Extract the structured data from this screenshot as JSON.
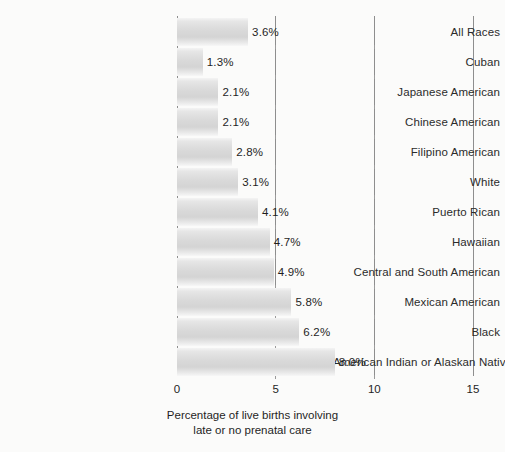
{
  "chart_data": {
    "type": "bar",
    "orientation": "horizontal",
    "title": "",
    "xlabel": "Percentage of live births involving late or no prenatal care",
    "xlabel_lines": [
      "Percentage of live births involving",
      "late or no prenatal care"
    ],
    "ylabel": "",
    "xlim": [
      0,
      15
    ],
    "xticks": [
      0,
      5,
      10,
      15
    ],
    "xtick_labels": [
      "0",
      "5",
      "10",
      "15"
    ],
    "grid": true,
    "grid_axis": "x",
    "legend": false,
    "value_suffix": "%",
    "categories": [
      "All Races",
      "Cuban",
      "Japanese American",
      "Chinese American",
      "Filipino American",
      "White",
      "Puerto Rican",
      "Hawaiian",
      "Central and South American",
      "Mexican American",
      "Black",
      "American Indian or Alaskan Native"
    ],
    "values": [
      3.6,
      1.3,
      2.1,
      2.1,
      2.8,
      3.1,
      4.1,
      4.7,
      4.9,
      5.8,
      6.2,
      8.0
    ],
    "value_labels": [
      "3.6%",
      "1.3%",
      "2.1%",
      "2.1%",
      "2.8%",
      "3.1%",
      "4.1%",
      "4.7%",
      "4.9%",
      "5.8%",
      "6.2%",
      "8.0%"
    ],
    "colors": {
      "bar_light": "#f4f4f4",
      "bar_mid": "#d6d6d6",
      "axis_line": "#8e8e8e",
      "text": "#1f1f1f",
      "background": "#fbfbfa"
    }
  }
}
